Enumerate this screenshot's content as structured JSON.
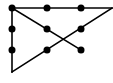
{
  "diagram": {
    "colors": {
      "line": "#000000",
      "dot": "#000000",
      "background": "#ffffff"
    },
    "dots": [
      {
        "x": 12,
        "y": 8
      },
      {
        "x": 47,
        "y": 8
      },
      {
        "x": 81,
        "y": 8
      },
      {
        "x": 12,
        "y": 29
      },
      {
        "x": 47,
        "y": 29
      },
      {
        "x": 81,
        "y": 29
      },
      {
        "x": 12,
        "y": 50
      },
      {
        "x": 47,
        "y": 50
      },
      {
        "x": 81,
        "y": 50
      }
    ],
    "lines": [
      {
        "x1": 12,
        "y1": 8,
        "x2": 112,
        "y2": 8
      },
      {
        "x1": 112,
        "y1": 8,
        "x2": 12,
        "y2": 72
      },
      {
        "x1": 12,
        "y1": 72,
        "x2": 12,
        "y2": 8
      },
      {
        "x1": 12,
        "y1": 8,
        "x2": 81,
        "y2": 50
      }
    ],
    "dot_radius": 3.5,
    "line_width": 1.6
  }
}
